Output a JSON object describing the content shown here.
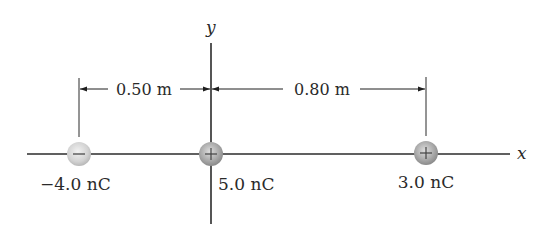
{
  "diagram": {
    "axes": {
      "x_label": "x",
      "y_label": "y"
    },
    "dimensions": [
      {
        "label": "0.50 m",
        "from": "charge-1",
        "to": "charge-2"
      },
      {
        "label": "0.80 m",
        "from": "charge-2",
        "to": "charge-3"
      }
    ],
    "charges": [
      {
        "id": "charge-1",
        "label": "−4.0 nC",
        "sign": "−",
        "position_m": -0.5
      },
      {
        "id": "charge-2",
        "label": "5.0 nC",
        "sign": "+",
        "position_m": 0.0
      },
      {
        "id": "charge-3",
        "label": "3.0 nC",
        "sign": "+",
        "position_m": 0.8
      }
    ],
    "colors": {
      "axis": "#2b2b2b",
      "negative_charge": "#d0d0d0",
      "positive_charge": "#a8a8a8",
      "text": "#2a2a2a"
    }
  }
}
